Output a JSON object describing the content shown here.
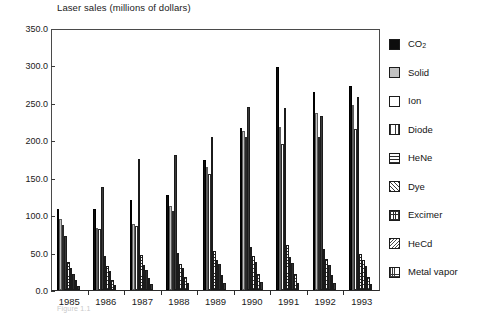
{
  "chart_data": {
    "type": "bar",
    "title": "Laser sales (millions of dollars)",
    "xlabel": "",
    "ylabel": "",
    "ylim": [
      0,
      350
    ],
    "ytick_values": [
      0.0,
      50.0,
      100.0,
      150.0,
      200.0,
      250.0,
      300.0,
      350.0
    ],
    "ytick_labels": [
      "0.0",
      "50.0",
      "100.0",
      "150.0",
      "200.0",
      "250.0",
      "300.0",
      "350.0"
    ],
    "grid": false,
    "legend_position": "right",
    "categories": [
      "1985",
      "1986",
      "1987",
      "1988",
      "1989",
      "1990",
      "1991",
      "1992",
      "1993"
    ],
    "series": [
      {
        "name": "CO2",
        "label": "CO",
        "sublabel": "2",
        "pattern": "solid-black",
        "color": "#0d0d0d",
        "values": [
          108,
          108,
          120,
          127,
          174,
          217,
          298,
          265,
          272
        ]
      },
      {
        "name": "Solid",
        "label": "Solid",
        "pattern": "light-gray",
        "color": "#c2c2c2",
        "values": [
          95,
          83,
          88,
          112,
          165,
          212,
          218,
          237,
          247
        ]
      },
      {
        "name": "Ion",
        "label": "Ion",
        "pattern": "white",
        "color": "#ffffff",
        "values": [
          87,
          82,
          85,
          105,
          155,
          205,
          195,
          205,
          215
        ]
      },
      {
        "name": "Diode",
        "label": "Diode",
        "pattern": "vertical-lines",
        "color": "#3a3a3a",
        "values": [
          72,
          137,
          175,
          180,
          205,
          245,
          243,
          233,
          258
        ]
      },
      {
        "name": "HeNe",
        "label": "HeNe",
        "pattern": "horizontal-lines",
        "color": "#2e2e2e",
        "values": [
          38,
          45,
          47,
          50,
          52,
          57,
          60,
          55,
          48
        ]
      },
      {
        "name": "Dye",
        "label": "Dye",
        "pattern": "diagonal-hatch",
        "color": "#3a3a3a",
        "values": [
          30,
          32,
          33,
          35,
          40,
          45,
          44,
          42,
          40
        ]
      },
      {
        "name": "Excimer",
        "label": "Excimer",
        "pattern": "crosshatch",
        "color": "#2e2e2e",
        "values": [
          22,
          25,
          27,
          30,
          35,
          38,
          36,
          34,
          32
        ]
      },
      {
        "name": "HeCd",
        "label": "HeCd",
        "pattern": "diagonal-lines",
        "color": "#4a4a4a",
        "values": [
          13,
          14,
          16,
          18,
          20,
          22,
          21,
          20,
          18
        ]
      },
      {
        "name": "Metal vapor",
        "label": "Metal vapor",
        "pattern": "fine-grid",
        "color": "#3a3a3a",
        "values": [
          6,
          7,
          8,
          9,
          10,
          11,
          10,
          9,
          8
        ]
      }
    ]
  },
  "legend": {
    "items": [
      {
        "label": "CO",
        "sub": "2",
        "swatch": "co2"
      },
      {
        "label": "Solid",
        "sub": "",
        "swatch": "solid"
      },
      {
        "label": "Ion",
        "sub": "",
        "swatch": "ion"
      },
      {
        "label": "Diode",
        "sub": "",
        "swatch": "diode"
      },
      {
        "label": "HeNe",
        "sub": "",
        "swatch": "hene"
      },
      {
        "label": "Dye",
        "sub": "",
        "swatch": "dye"
      },
      {
        "label": "Excimer",
        "sub": "",
        "swatch": "excimer"
      },
      {
        "label": "HeCd",
        "sub": "",
        "swatch": "hecd"
      },
      {
        "label": "Metal vapor",
        "sub": "",
        "swatch": "metal"
      }
    ]
  },
  "caption": "Figure 1.1"
}
